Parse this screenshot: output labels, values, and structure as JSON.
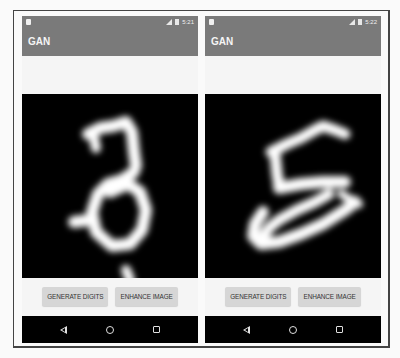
{
  "screens": [
    {
      "status_time": "5:21",
      "app_title": "GAN",
      "digit_shown": "3",
      "buttons": {
        "generate": "GENERATE DIGITS",
        "enhance": "ENHANCE IMAGE"
      },
      "nav": {
        "back": "back-icon",
        "home": "home-icon",
        "recents": "recents-icon"
      }
    },
    {
      "status_time": "5:22",
      "app_title": "GAN",
      "digit_shown": "5",
      "buttons": {
        "generate": "GENERATE DIGITS",
        "enhance": "ENHANCE IMAGE"
      },
      "nav": {
        "back": "back-icon",
        "home": "home-icon",
        "recents": "recents-icon"
      }
    }
  ],
  "colors": {
    "appbar": "#7a7a7a",
    "canvas_bg": "#000000",
    "button_bg": "#d6d6d6",
    "navbar": "#000000"
  }
}
